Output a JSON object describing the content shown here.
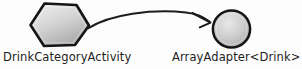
{
  "diagram": {
    "background_color": "#fdfdfd",
    "stroke_color": "#1d1d1d",
    "style": "hand-drawn-sketch",
    "nodes": [
      {
        "id": "activity",
        "label": "DrinkCategoryActivity",
        "shape": "hexagon",
        "fill_light": "#e6e6e6",
        "fill_dark": "#a8a8a8",
        "outline_color": "#151515"
      },
      {
        "id": "adapter",
        "label": "ArrayAdapter<Drink>",
        "shape": "circle",
        "fill_light": "#e2e2e2",
        "fill_dark": "#a5a5a5",
        "outline_color": "#151515"
      }
    ],
    "edges": [
      {
        "id": "activity-to-adapter",
        "from": "activity",
        "to": "adapter",
        "label": "",
        "arrowhead": "open-v",
        "curve": "arc-up"
      }
    ]
  }
}
